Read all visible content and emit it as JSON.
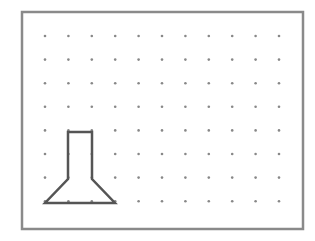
{
  "label": ")",
  "grid": {
    "cols": 11,
    "rows": 8,
    "x0": 45,
    "y0": 36,
    "dx": 23.4,
    "dy": 23.6,
    "dot_color": "#888888"
  },
  "frame": {
    "x": 22,
    "y": 12,
    "width": 281,
    "height": 217,
    "color": "#8a8a8a"
  },
  "shape": {
    "name": "flask-shape",
    "points": [
      [
        68,
        132
      ],
      [
        92,
        132
      ],
      [
        92,
        179
      ],
      [
        115,
        203
      ],
      [
        45,
        203
      ],
      [
        68,
        179
      ]
    ],
    "stroke": "#555555"
  }
}
